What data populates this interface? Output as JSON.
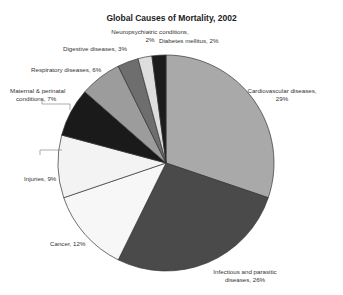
{
  "chart_data": {
    "type": "pie",
    "title": "Global Causes of Mortality, 2002",
    "xlabel": "",
    "ylabel": "",
    "legend": "none (direct labels)",
    "slices": [
      {
        "label": "Cardiovascular diseases",
        "value": 29,
        "color": "#a9a9a9"
      },
      {
        "label": "Infectious and parasitic diseases",
        "value": 26,
        "color": "#4a4a4a"
      },
      {
        "label": "Cancer",
        "value": 12,
        "color": "#f7f7f7"
      },
      {
        "label": "Injuries",
        "value": 9,
        "color": "#f3f3f3"
      },
      {
        "label": "Maternal & perinatal conditions",
        "value": 7,
        "color": "#1a1a1a"
      },
      {
        "label": "Respiratory diseases",
        "value": 6,
        "color": "#9c9c9c"
      },
      {
        "label": "Digestive diseases",
        "value": 3,
        "color": "#6e6e6e"
      },
      {
        "label": "Neuropsychiatric conditions",
        "value": 2,
        "color": "#dedede"
      },
      {
        "label": "Diabetes mellitus",
        "value": 2,
        "color": "#1c1c1c"
      }
    ]
  },
  "labels": {
    "title": "Global Causes of Mortality, 2002",
    "cardio_1": "Cardiovascular diseases,",
    "cardio_2": "29%",
    "infect_1": "Infectious and parasitic",
    "infect_2": "diseases, 26%",
    "cancer": "Cancer, 12%",
    "injuries": "Injuries, 9%",
    "maternal_1": "Maternal & perinatal",
    "maternal_2": "conditions, 7%",
    "resp": "Respiratory diseases, 6%",
    "digest": "Digestive diseases, 3%",
    "neuro_1": "Neuropsychiatric conditions,",
    "neuro_2": "2%",
    "diabetes": "Diabetes mellitus, 2%"
  }
}
